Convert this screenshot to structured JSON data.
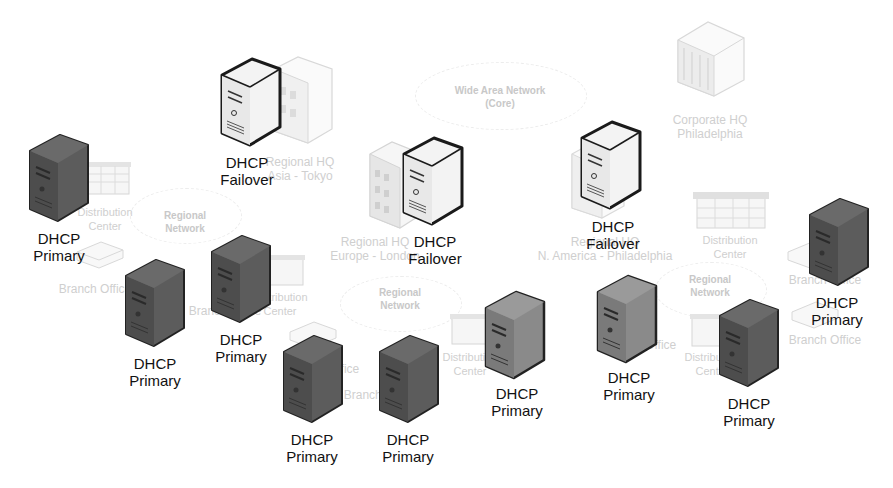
{
  "diagram": {
    "type": "network-topology",
    "theme": {
      "server_dark": "#5a5a5a",
      "server_dark_side": "#4a4a4a",
      "server_light": "#f2f2f2",
      "outline": "#1a1a1a",
      "faint_text": "#cfcfcf",
      "label_text": "#111111"
    },
    "clouds": [
      {
        "id": "wan",
        "line1": "Wide Area Network",
        "line2": "(Core)"
      },
      {
        "id": "regional-left",
        "line1": "Regional",
        "line2": "Network"
      },
      {
        "id": "regional-center",
        "line1": "Regional",
        "line2": "Network"
      },
      {
        "id": "regional-right",
        "line1": "Regional",
        "line2": "Network"
      }
    ],
    "sites": [
      {
        "id": "corporate-hq",
        "line1": "Corporate HQ",
        "line2": "Philadelphia"
      },
      {
        "id": "regional-hq-tokyo",
        "line1": "Regional HQ",
        "line2": "Asia - Tokyo"
      },
      {
        "id": "regional-hq-europe",
        "line1": "Regional HQ",
        "line2": "Europe - London"
      },
      {
        "id": "regional-hq-na",
        "line1": "Regional HQ",
        "line2": "N. America - Philadelphia"
      },
      {
        "id": "dc-left",
        "line1": "Distribution",
        "line2": "Center"
      },
      {
        "id": "dc-left2",
        "line1": "Distribution",
        "line2": "Center"
      },
      {
        "id": "dc-center",
        "line1": "Distribution",
        "line2": "Center"
      },
      {
        "id": "dc-right",
        "line1": "Distribution",
        "line2": "Center"
      },
      {
        "id": "dc-right2",
        "line1": "Distribution",
        "line2": "Center"
      },
      {
        "id": "bo-left",
        "line1": "Branch Office",
        "line2": ""
      },
      {
        "id": "bo-left2",
        "line1": "Branch Office",
        "line2": ""
      },
      {
        "id": "bo-center",
        "line1": "Branch Office",
        "line2": ""
      },
      {
        "id": "bo-center2",
        "line1": "Branch Office",
        "line2": ""
      },
      {
        "id": "bo-center3",
        "line1": "Branch Office",
        "line2": ""
      },
      {
        "id": "bo-right",
        "line1": "Branch Office",
        "line2": ""
      },
      {
        "id": "bo-right2",
        "line1": "Branch Office",
        "line2": ""
      }
    ],
    "servers": [
      {
        "id": "s1",
        "role": "Failover",
        "line1": "DHCP",
        "line2": "Failover",
        "style": "light"
      },
      {
        "id": "s2",
        "role": "Failover",
        "line1": "DHCP",
        "line2": "Failover",
        "style": "light"
      },
      {
        "id": "s3",
        "role": "Failover",
        "line1": "DHCP",
        "line2": "Failover",
        "style": "light"
      },
      {
        "id": "s4",
        "role": "Primary",
        "line1": "DHCP",
        "line2": "Primary",
        "style": "dark"
      },
      {
        "id": "s5",
        "role": "Primary",
        "line1": "DHCP",
        "line2": "Primary",
        "style": "dark"
      },
      {
        "id": "s6",
        "role": "Primary",
        "line1": "DHCP",
        "line2": "Primary",
        "style": "dark"
      },
      {
        "id": "s7",
        "role": "Primary",
        "line1": "DHCP",
        "line2": "Primary",
        "style": "dark"
      },
      {
        "id": "s8",
        "role": "Primary",
        "line1": "DHCP",
        "line2": "Primary",
        "style": "dark"
      },
      {
        "id": "s9",
        "role": "Primary",
        "line1": "DHCP",
        "line2": "Primary",
        "style": "dark"
      },
      {
        "id": "s10",
        "role": "Primary",
        "line1": "DHCP",
        "line2": "Primary",
        "style": "dark"
      },
      {
        "id": "s11",
        "role": "Primary",
        "line1": "DHCP",
        "line2": "Primary",
        "style": "dark"
      },
      {
        "id": "s12",
        "role": "Primary",
        "line1": "DHCP",
        "line2": "Primary",
        "style": "dark"
      }
    ]
  }
}
